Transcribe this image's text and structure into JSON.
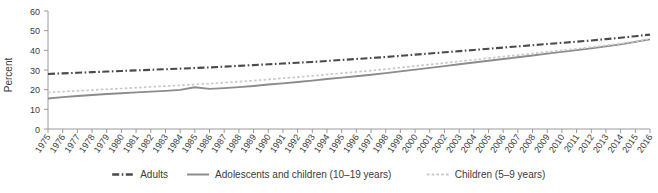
{
  "chart_data": {
    "type": "line",
    "title": "",
    "xlabel": "",
    "ylabel": "Percent",
    "ylim": [
      0,
      60
    ],
    "yticks": [
      0,
      10,
      20,
      30,
      40,
      50,
      60
    ],
    "grid": false,
    "legend_position": "bottom",
    "x": [
      1975,
      1976,
      1977,
      1978,
      1979,
      1980,
      1981,
      1982,
      1983,
      1984,
      1985,
      1986,
      1987,
      1988,
      1989,
      1990,
      1991,
      1992,
      1993,
      1994,
      1995,
      1996,
      1997,
      1998,
      1999,
      2000,
      2001,
      2002,
      2003,
      2004,
      2005,
      2006,
      2007,
      2008,
      2009,
      2010,
      2011,
      2012,
      2013,
      2014,
      2015,
      2016
    ],
    "xtick_labels": [
      "1975",
      "1976",
      "1977",
      "1978",
      "1979",
      "1980",
      "1981",
      "1982",
      "1983",
      "1984",
      "1985",
      "1986",
      "1987",
      "1988",
      "1989",
      "1990",
      "1991",
      "1992",
      "1993",
      "1994",
      "1995",
      "1996",
      "1997",
      "1998",
      "1999",
      "2000",
      "2001",
      "2002",
      "2003",
      "2004",
      "2005",
      "2006",
      "2007",
      "2008",
      "2009",
      "2010",
      "2011",
      "2012",
      "2013",
      "2014",
      "2015",
      "2016"
    ],
    "series": [
      {
        "name": "Adults",
        "style": "dash-dot",
        "color": "#4a4a4a",
        "values": [
          28.0,
          28.3,
          28.6,
          28.9,
          29.2,
          29.5,
          29.8,
          30.1,
          30.4,
          30.7,
          31.0,
          31.3,
          31.7,
          32.1,
          32.5,
          32.9,
          33.3,
          33.7,
          34.1,
          34.6,
          35.1,
          35.6,
          36.1,
          36.6,
          37.2,
          37.8,
          38.4,
          39.0,
          39.6,
          40.2,
          40.8,
          41.4,
          42.0,
          42.6,
          43.2,
          43.8,
          44.4,
          45.0,
          45.7,
          46.4,
          47.2,
          48.0
        ]
      },
      {
        "name": "Adolescents and children (10–19 years)",
        "style": "solid",
        "color": "#8c8c8c",
        "values": [
          15.5,
          16.2,
          16.8,
          17.3,
          17.8,
          18.2,
          18.6,
          19.0,
          19.4,
          19.9,
          21.2,
          20.4,
          20.8,
          21.3,
          21.9,
          22.6,
          23.2,
          23.9,
          24.6,
          25.4,
          26.1,
          26.8,
          27.6,
          28.4,
          29.3,
          30.2,
          31.1,
          32.0,
          32.9,
          33.8,
          34.7,
          35.6,
          36.5,
          37.4,
          38.3,
          39.2,
          40.1,
          41.0,
          42.0,
          43.0,
          44.3,
          45.6
        ]
      },
      {
        "name": "Children (5–9 years)",
        "style": "dotted",
        "color": "#c9c9c9",
        "values": [
          18.6,
          19.0,
          19.4,
          19.8,
          20.2,
          20.6,
          21.0,
          21.4,
          21.8,
          22.2,
          22.7,
          23.1,
          23.6,
          24.1,
          24.6,
          25.2,
          25.8,
          26.4,
          27.0,
          27.7,
          28.4,
          29.0,
          29.7,
          30.4,
          31.2,
          32.0,
          32.8,
          33.6,
          34.4,
          35.2,
          36.0,
          36.8,
          37.6,
          38.4,
          39.2,
          40.0,
          40.8,
          41.6,
          42.5,
          43.4,
          44.5,
          45.8
        ]
      }
    ]
  },
  "legend": {
    "items": [
      {
        "label": "Adults",
        "marker": "dash-dot-line-icon"
      },
      {
        "label": "Adolescents and children (10–19 years)",
        "marker": "solid-line-icon"
      },
      {
        "label": "Children (5–9 years)",
        "marker": "dotted-line-icon"
      }
    ]
  },
  "colors": {
    "adults": "#4a4a4a",
    "adolescents": "#8c8c8c",
    "children": "#c9c9c9",
    "axis": "#9a9a9a",
    "text": "#3b3b3b",
    "background": "#ffffff"
  }
}
